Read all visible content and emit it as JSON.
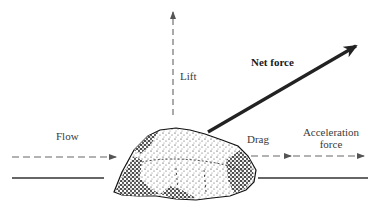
{
  "diagram": {
    "labels": {
      "lift": "Lift",
      "net_force": "Net force",
      "flow": "Flow",
      "drag": "Drag",
      "acceleration_line1": "Acceleration",
      "acceleration_line2": "force"
    },
    "elements": {
      "particle": "rock / sediment grain resting on bed",
      "bed": "solid bed surface line",
      "forces": [
        "Lift (vertical, dashed)",
        "Net force (diagonal, solid bold)",
        "Drag (horizontal, dashed)",
        "Acceleration force (horizontal, dashed)"
      ],
      "flow": "Flow direction (horizontal, dashed, left to right)"
    },
    "colors": {
      "line": "#2a2a2a",
      "dashed": "#555555",
      "rock_dark": "#111111"
    }
  }
}
